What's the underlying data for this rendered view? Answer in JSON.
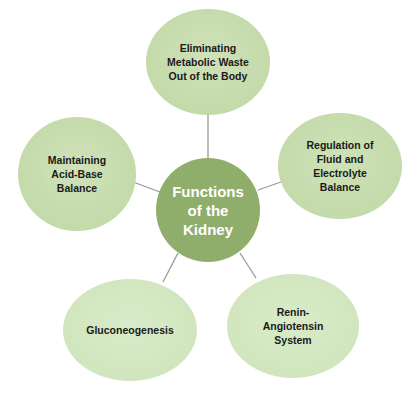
{
  "title": "Functions of the Kidney",
  "colors": {
    "center_fill": "#8fae6c",
    "outer_fill": "#c6dcac",
    "outer_fill_light": "#d6e8c5",
    "connector": "#9a9a92",
    "text_dark": "#1a1a1a",
    "text_light": "#ffffff"
  },
  "center": {
    "label": "Functions\nof the\nKidney"
  },
  "nodes": [
    {
      "id": "top",
      "label": "Eliminating\nMetabolic Waste\nOut of the Body"
    },
    {
      "id": "right",
      "label": "Regulation of\nFluid and\nElectrolyte\nBalance"
    },
    {
      "id": "bottom-right",
      "label": "Renin-\nAngiotensin\nSystem"
    },
    {
      "id": "bottom-left",
      "label": "Gluconeogenesis"
    },
    {
      "id": "left",
      "label": "Maintaining\nAcid-Base\nBalance"
    }
  ]
}
